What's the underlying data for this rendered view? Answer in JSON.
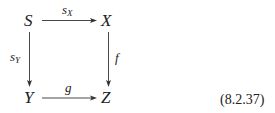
{
  "diagram": {
    "type": "commutative-square",
    "nodes": {
      "top_left": "S",
      "top_right": "X",
      "bottom_left": "Y",
      "bottom_right": "Z"
    },
    "arrows": {
      "top": {
        "from": "S",
        "to": "X",
        "label_base": "s",
        "label_sub": "X"
      },
      "left": {
        "from": "S",
        "to": "Y",
        "label_base": "s",
        "label_sub": "Y"
      },
      "right": {
        "from": "X",
        "to": "Z",
        "label_base": "f",
        "label_sub": ""
      },
      "bottom": {
        "from": "Y",
        "to": "Z",
        "label_base": "g",
        "label_sub": ""
      }
    },
    "equation_number": "(8.2.37)"
  }
}
